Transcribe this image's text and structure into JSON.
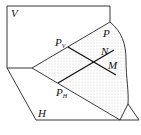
{
  "diagram": {
    "labels": {
      "V": "V",
      "H": "H",
      "P": "P",
      "N": "N",
      "M": "M",
      "PV_main": "P",
      "PV_sub": "V",
      "PH_main": "P",
      "PH_sub": "H"
    },
    "colors": {
      "stroke": "#222222",
      "dots": "#9a9a9a",
      "background": "#ffffff"
    }
  }
}
